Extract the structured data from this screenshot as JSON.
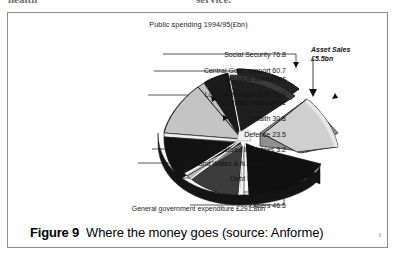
{
  "page": {
    "top_fragments": [
      "health",
      "service."
    ]
  },
  "figure": {
    "caption_figure": "Figure 9",
    "caption_text": "Where the money goes (source: Anforme)",
    "footnote": "General government expenditure £291.8bn"
  },
  "chart_data": {
    "type": "pie",
    "title": "Public spending 1994/95(£bn)",
    "units": "£bn",
    "total_label": "General government expenditure £291.8bn",
    "total": 291.8,
    "exploded": [
      "Asset Sales",
      "Social Security"
    ],
    "three_d": true,
    "legend_position": "callout-labels",
    "categories": [
      "Social Security",
      "Central Govt. support to local authorities",
      "Local authorities self-financed expenditure",
      "Health",
      "Defence",
      "Nationalised Industries",
      "Scotland Wales & N. Ireland",
      "Debt Interest",
      "Reserve",
      "Others",
      "Asset Sales"
    ],
    "values": [
      76.8,
      60.7,
      11.0,
      30.8,
      23.5,
      3.2,
      18.9,
      22.5,
      3.2,
      46.5,
      5.5
    ],
    "callouts": [
      {
        "text": "Social Security 76.8",
        "x": 152,
        "y": 38,
        "w": 126
      },
      {
        "text": "Central Govt. support 60.7\nto local authorities",
        "x": 142,
        "y": 54,
        "w": 136
      },
      {
        "text": "Local authorities self- 11.0\nfinanced expenditure",
        "x": 136,
        "y": 78,
        "w": 142
      },
      {
        "text": "Health 30.8",
        "x": 178,
        "y": 102,
        "w": 100
      },
      {
        "text": "Defence 23.5",
        "x": 178,
        "y": 118,
        "w": 100
      },
      {
        "text": "Nationalised Industries 3.2",
        "x": 140,
        "y": 133,
        "w": 138
      },
      {
        "text": "Scotland Wales & N. Ireland 18.9",
        "x": 126,
        "y": 147,
        "w": 152
      },
      {
        "text": "Debt Interest 22.5",
        "x": 162,
        "y": 162,
        "w": 116
      },
      {
        "text": "Reserve 3.2",
        "x": 178,
        "y": 176,
        "w": 100
      },
      {
        "text": "Others 46.5",
        "x": 178,
        "y": 189,
        "w": 100
      }
    ],
    "asset_callout": "Asset Sales\n£5.5bn",
    "colors": {
      "dark": "#111111",
      "mid_dark": "#2b2b2b",
      "light_grey": "#bdbdbd",
      "pale_grey": "#d8d8d8",
      "white": "#ffffff",
      "frame": "#8d8d8d"
    }
  }
}
